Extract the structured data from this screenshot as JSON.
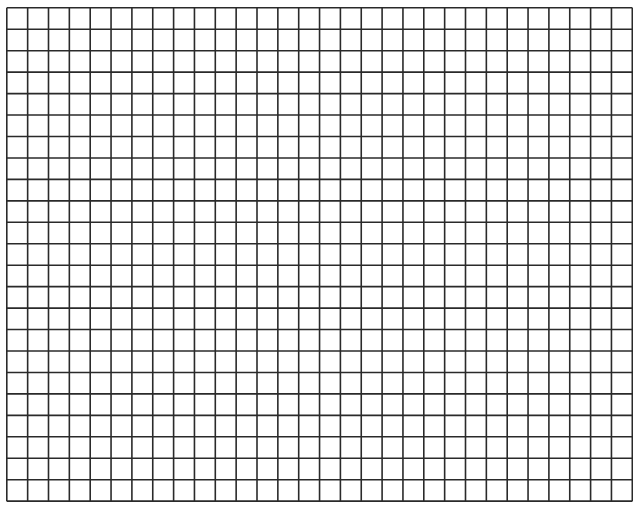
{
  "grid": {
    "columns": 30,
    "rows": 23,
    "cell_width": 20.85,
    "cell_height": 21.45,
    "line_color": "#2a2a2a",
    "line_width": 1.6,
    "background": "#ffffff"
  }
}
